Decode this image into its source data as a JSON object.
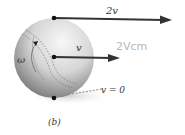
{
  "figure": {
    "panel_label": "(b)",
    "labels": {
      "top_velocity": "2v",
      "center_velocity": "v",
      "angular_velocity": "ω",
      "bottom_velocity": "v = 0",
      "handwritten_note": "2Vcm"
    },
    "colors": {
      "arrow": "#333333",
      "sphere_light": "#f4f4f4",
      "sphere_dark": "#555555",
      "shadow": "#d8d8d8",
      "handwriting": "#b8b8b8"
    }
  }
}
